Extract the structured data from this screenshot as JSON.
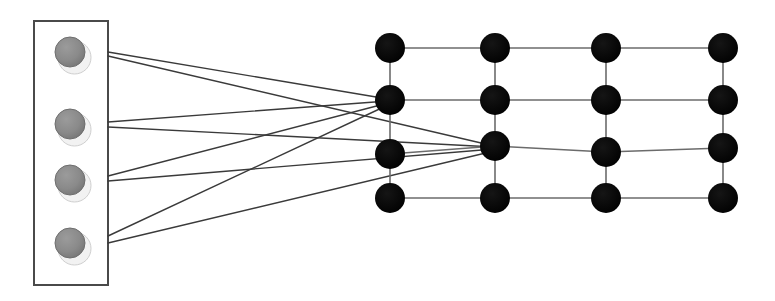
{
  "diagram": {
    "title": "Bipartite mapping from a source module to a 4x4 lattice",
    "type": "node-link-diagram",
    "background_color": "#ffffff",
    "canvas": {
      "width": 775,
      "height": 301
    }
  },
  "source_panel": {
    "label": "source-module",
    "x": 34,
    "y": 21,
    "width": 74,
    "height": 264,
    "border_color": "#4a4a4a",
    "border_width": 2,
    "fill_color": "#ffffff",
    "node_count": 4,
    "node_radius": 15,
    "node_fill_color": "#8a8a8a",
    "node_edge_color": "#6e6e6e",
    "node_highlight_color": "#f2f2f2",
    "nodes": [
      {
        "id": "s1",
        "label": "S1",
        "cx": 70,
        "cy": 52
      },
      {
        "id": "s2",
        "label": "S2",
        "cx": 70,
        "cy": 124
      },
      {
        "id": "s3",
        "label": "S3",
        "cx": 70,
        "cy": 180
      },
      {
        "id": "s4",
        "label": "S4",
        "cx": 70,
        "cy": 243
      }
    ]
  },
  "lattice": {
    "label": "target-lattice",
    "rows": 4,
    "columns": 4,
    "node_radius": 15,
    "node_fill_color": "#0a0a0a",
    "link_color": "#6b6b6b",
    "link_width": 1.6,
    "column_x": [
      390,
      495,
      606,
      723
    ],
    "row_y": [
      48,
      100,
      150,
      198
    ],
    "nodes": [
      {
        "id": "n11",
        "label": "R1C1",
        "cx": 390,
        "cy": 48
      },
      {
        "id": "n12",
        "label": "R1C2",
        "cx": 495,
        "cy": 48
      },
      {
        "id": "n13",
        "label": "R1C3",
        "cx": 606,
        "cy": 48
      },
      {
        "id": "n14",
        "label": "R1C4",
        "cx": 723,
        "cy": 48
      },
      {
        "id": "n21",
        "label": "R2C1",
        "cx": 390,
        "cy": 100
      },
      {
        "id": "n22",
        "label": "R2C2",
        "cx": 495,
        "cy": 100
      },
      {
        "id": "n23",
        "label": "R2C3",
        "cx": 606,
        "cy": 100
      },
      {
        "id": "n24",
        "label": "R2C4",
        "cx": 723,
        "cy": 100
      },
      {
        "id": "n31",
        "label": "R3C1",
        "cx": 390,
        "cy": 154
      },
      {
        "id": "n32",
        "label": "R3C2",
        "cx": 495,
        "cy": 146
      },
      {
        "id": "n33",
        "label": "R3C3",
        "cx": 606,
        "cy": 152
      },
      {
        "id": "n34",
        "label": "R3C4",
        "cx": 723,
        "cy": 148
      },
      {
        "id": "n41",
        "label": "R4C1",
        "cx": 390,
        "cy": 198
      },
      {
        "id": "n42",
        "label": "R4C2",
        "cx": 495,
        "cy": 198
      },
      {
        "id": "n43",
        "label": "R4C3",
        "cx": 606,
        "cy": 198
      },
      {
        "id": "n44",
        "label": "R4C4",
        "cx": 723,
        "cy": 198
      }
    ],
    "links": [
      {
        "from": "n11",
        "to": "n12"
      },
      {
        "from": "n12",
        "to": "n13"
      },
      {
        "from": "n13",
        "to": "n14"
      },
      {
        "from": "n21",
        "to": "n22"
      },
      {
        "from": "n22",
        "to": "n23"
      },
      {
        "from": "n23",
        "to": "n24"
      },
      {
        "from": "n31",
        "to": "n32"
      },
      {
        "from": "n32",
        "to": "n33"
      },
      {
        "from": "n33",
        "to": "n34"
      },
      {
        "from": "n41",
        "to": "n42"
      },
      {
        "from": "n42",
        "to": "n43"
      },
      {
        "from": "n43",
        "to": "n44"
      },
      {
        "from": "n11",
        "to": "n21"
      },
      {
        "from": "n21",
        "to": "n31"
      },
      {
        "from": "n31",
        "to": "n41"
      },
      {
        "from": "n12",
        "to": "n22"
      },
      {
        "from": "n22",
        "to": "n32"
      },
      {
        "from": "n32",
        "to": "n42"
      },
      {
        "from": "n13",
        "to": "n23"
      },
      {
        "from": "n23",
        "to": "n33"
      },
      {
        "from": "n33",
        "to": "n43"
      },
      {
        "from": "n14",
        "to": "n24"
      },
      {
        "from": "n24",
        "to": "n34"
      },
      {
        "from": "n34",
        "to": "n44"
      }
    ]
  },
  "mapping_edges": {
    "label": "mapping-edges",
    "color": "#3a3a3a",
    "width": 1.4,
    "count": 8,
    "edges": [
      {
        "id": "e1",
        "from": "s1",
        "to": "n21",
        "x1": 108,
        "y1": 52,
        "x2": 388,
        "y2": 99
      },
      {
        "id": "e2",
        "from": "s1",
        "to": "n32",
        "x1": 108,
        "y1": 56,
        "x2": 494,
        "y2": 146
      },
      {
        "id": "e3",
        "from": "s2",
        "to": "n21",
        "x1": 108,
        "y1": 122,
        "x2": 388,
        "y2": 101
      },
      {
        "id": "e4",
        "from": "s2",
        "to": "n32",
        "x1": 108,
        "y1": 127,
        "x2": 494,
        "y2": 147
      },
      {
        "id": "e5",
        "from": "s3",
        "to": "n21",
        "x1": 108,
        "y1": 176,
        "x2": 388,
        "y2": 103
      },
      {
        "id": "e6",
        "from": "s3",
        "to": "n32",
        "x1": 108,
        "y1": 181,
        "x2": 494,
        "y2": 149
      },
      {
        "id": "e7",
        "from": "s4",
        "to": "n21",
        "x1": 108,
        "y1": 236,
        "x2": 388,
        "y2": 105
      },
      {
        "id": "e8",
        "from": "s4",
        "to": "n32",
        "x1": 108,
        "y1": 243,
        "x2": 494,
        "y2": 151
      }
    ]
  }
}
